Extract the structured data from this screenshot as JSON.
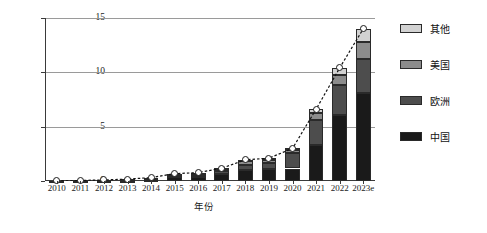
{
  "chart_data": {
    "type": "bar",
    "subtype": "stacked-bar-with-line-overlay",
    "title": "",
    "xlabel": "年份",
    "ylabel": "销量(×10⁶)",
    "ylabel_base": "销量(×10",
    "ylabel_exp": "6",
    "ylabel_tail": ")",
    "categories": [
      "2010",
      "2011",
      "2012",
      "2013",
      "2014",
      "2015",
      "2016",
      "2017",
      "2018",
      "2019",
      "2020",
      "2021",
      "2022",
      "2023e"
    ],
    "ylim": [
      0,
      15
    ],
    "yticks": [
      0,
      5,
      10,
      15
    ],
    "ytick_labels": [
      "0",
      "5",
      "10",
      "15"
    ],
    "grid": true,
    "grid_axis": "y",
    "legend_position": "right",
    "series": [
      {
        "name": "中国",
        "key": "cn",
        "color": "#1a1a1a",
        "values": [
          0.01,
          0.02,
          0.02,
          0.02,
          0.08,
          0.33,
          0.34,
          0.6,
          1.05,
          1.06,
          1.15,
          3.3,
          6.1,
          8.1
        ]
      },
      {
        "name": "欧洲",
        "key": "eu",
        "color": "#4d4d4d",
        "values": [
          0.01,
          0.01,
          0.02,
          0.04,
          0.08,
          0.19,
          0.22,
          0.31,
          0.41,
          0.58,
          1.4,
          2.3,
          2.7,
          3.1
        ]
      },
      {
        "name": "美国",
        "key": "us",
        "color": "#8c8c8c",
        "values": [
          0.01,
          0.01,
          0.05,
          0.1,
          0.12,
          0.12,
          0.16,
          0.2,
          0.36,
          0.33,
          0.3,
          0.65,
          1.0,
          1.6
        ]
      },
      {
        "name": "其他",
        "key": "ot",
        "color": "#d2d2d2",
        "values": [
          0.0,
          0.01,
          0.01,
          0.02,
          0.03,
          0.04,
          0.05,
          0.07,
          0.13,
          0.13,
          0.15,
          0.35,
          0.6,
          1.2
        ]
      }
    ],
    "totals": [
      0.03,
      0.05,
      0.1,
      0.18,
      0.31,
      0.68,
      0.77,
      1.18,
      1.95,
      2.1,
      3.0,
      6.6,
      10.4,
      14.0
    ],
    "line_overlay": {
      "name": "总销量",
      "style": "dotted",
      "marker": "circle-white-filled",
      "values": [
        0.03,
        0.05,
        0.1,
        0.18,
        0.31,
        0.68,
        0.77,
        1.18,
        1.95,
        2.1,
        3.0,
        6.6,
        10.4,
        14.0
      ]
    }
  },
  "legend": {
    "items": [
      {
        "label": "其他",
        "color": "#d2d2d2"
      },
      {
        "label": "美国",
        "color": "#8c8c8c"
      },
      {
        "label": "欧洲",
        "color": "#4d4d4d"
      },
      {
        "label": "中国",
        "color": "#1a1a1a"
      }
    ]
  }
}
